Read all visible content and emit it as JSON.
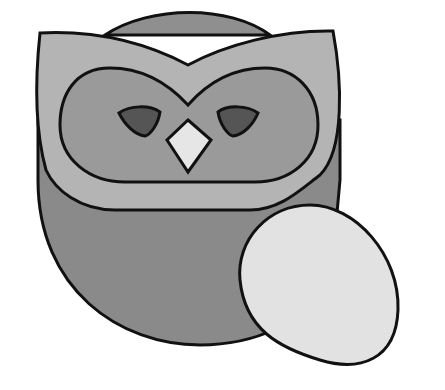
{
  "illustration": {
    "subject": "owl with egg",
    "colors": {
      "background": "#ffffff",
      "outline": "#111111",
      "body": "#8a8a8a",
      "head_top": "#8f8f8f",
      "face_plate": "#b4b4b4",
      "eye_mask": "#9a9a9a",
      "eyes": "#555555",
      "beak": "#e6e6e6",
      "egg": "#e2e2e2"
    }
  }
}
